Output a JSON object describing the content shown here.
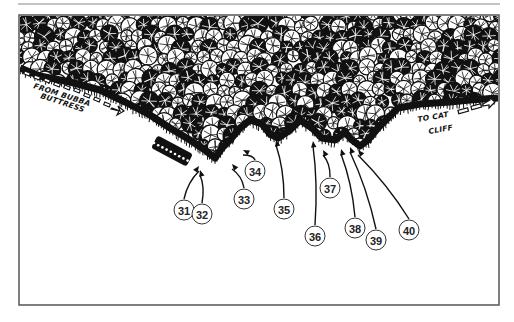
{
  "figure": {
    "type": "climbing-topo",
    "frame": {
      "x": 19,
      "y": 15,
      "width": 480,
      "height": 290,
      "stroke": "#555555"
    },
    "top_rule": {
      "x1": 18,
      "x2": 500,
      "y": 4,
      "stroke": "#888888"
    }
  },
  "labels": {
    "from_line1": "FROM BUBBA",
    "from_line2": "BUTTRESS",
    "to_line1": "TO CAT",
    "to_line2": "CLIFF"
  },
  "routes": [
    {
      "number": "31",
      "cx": 184,
      "cy": 210,
      "tip": [
        199,
        166
      ]
    },
    {
      "number": "32",
      "cx": 202,
      "cy": 214,
      "tip": [
        200,
        170
      ]
    },
    {
      "number": "33",
      "cx": 244,
      "cy": 199,
      "tip": [
        232,
        164
      ]
    },
    {
      "number": "34",
      "cx": 255,
      "cy": 171,
      "tip": [
        243,
        150
      ]
    },
    {
      "number": "35",
      "cx": 284,
      "cy": 209,
      "tip": [
        276,
        140
      ]
    },
    {
      "number": "36",
      "cx": 315,
      "cy": 236,
      "tip": [
        313,
        141
      ]
    },
    {
      "number": "37",
      "cx": 330,
      "cy": 188,
      "tip": [
        323,
        150
      ]
    },
    {
      "number": "38",
      "cx": 355,
      "cy": 228,
      "tip": [
        341,
        149
      ]
    },
    {
      "number": "39",
      "cx": 376,
      "cy": 240,
      "tip": [
        350,
        147
      ]
    },
    {
      "number": "40",
      "cx": 409,
      "cy": 230,
      "tip": [
        358,
        150
      ]
    }
  ],
  "colors": {
    "ink": "#111111",
    "paper": "#ffffff",
    "circle_stroke": "#333333"
  }
}
